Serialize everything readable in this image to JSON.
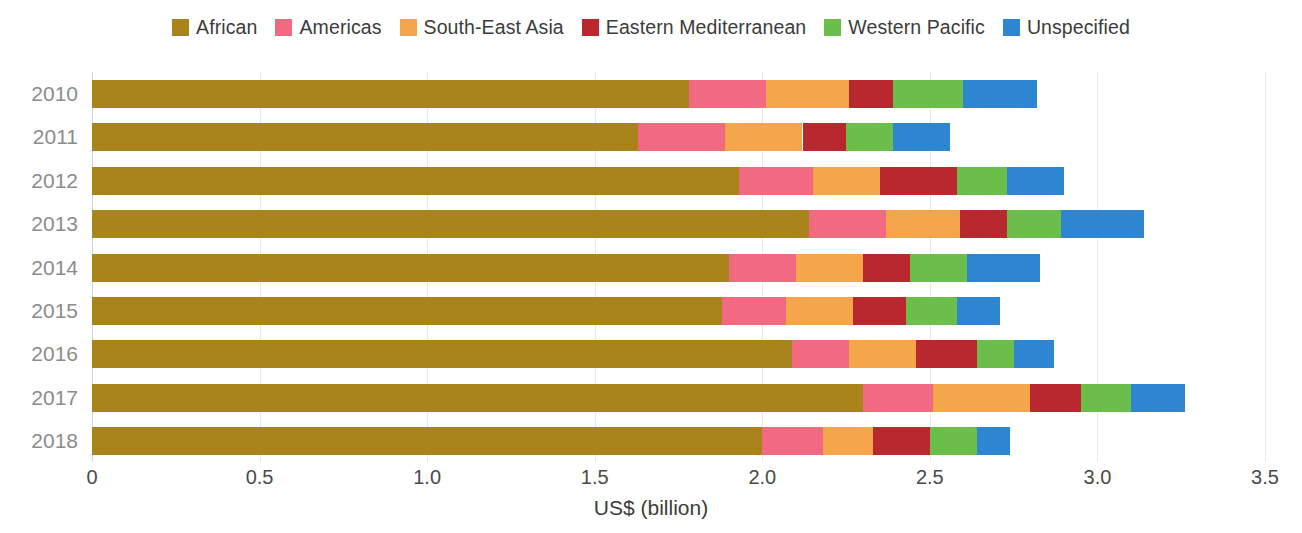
{
  "chart_data": {
    "type": "bar",
    "orientation": "horizontal",
    "stacked": true,
    "title": "",
    "subtitle": "",
    "xlabel": "US$ (billion)",
    "ylabel": "",
    "xlim": [
      0,
      3.5
    ],
    "xticks": [
      "0",
      "0.5",
      "1.0",
      "1.5",
      "2.0",
      "2.5",
      "3.0",
      "3.5"
    ],
    "xtick_values": [
      0,
      0.5,
      1.0,
      1.5,
      2.0,
      2.5,
      3.0,
      3.5
    ],
    "grid": true,
    "grid_axis": "x",
    "legend_position": "top-center",
    "categories": [
      "2010",
      "2011",
      "2012",
      "2013",
      "2014",
      "2015",
      "2016",
      "2017",
      "2018"
    ],
    "series": [
      {
        "name": "African",
        "color": "#A8841A",
        "values": [
          1.78,
          1.63,
          1.93,
          2.14,
          1.9,
          1.88,
          2.09,
          2.3,
          2.0
        ]
      },
      {
        "name": "Americas",
        "color": "#F26A82",
        "values": [
          0.23,
          0.26,
          0.22,
          0.23,
          0.2,
          0.19,
          0.17,
          0.21,
          0.18
        ]
      },
      {
        "name": "South-East Asia",
        "color": "#F5A64A",
        "values": [
          0.25,
          0.23,
          0.2,
          0.22,
          0.2,
          0.2,
          0.2,
          0.29,
          0.15
        ]
      },
      {
        "name": "Eastern Mediterranean",
        "color": "#B8282E",
        "values": [
          0.13,
          0.13,
          0.23,
          0.14,
          0.14,
          0.16,
          0.18,
          0.15,
          0.17
        ]
      },
      {
        "name": "Western Pacific",
        "color": "#6BBE4A",
        "values": [
          0.21,
          0.14,
          0.15,
          0.16,
          0.17,
          0.15,
          0.11,
          0.15,
          0.14
        ]
      },
      {
        "name": "Unspecified",
        "color": "#2E86D0",
        "values": [
          0.22,
          0.17,
          0.17,
          0.25,
          0.22,
          0.13,
          0.12,
          0.16,
          0.1
        ]
      }
    ],
    "totals": [
      2.82,
      2.56,
      2.9,
      3.14,
      2.83,
      2.71,
      2.87,
      3.26,
      2.74
    ]
  },
  "legend": {
    "items": [
      {
        "label": "African",
        "color": "#A8841A"
      },
      {
        "label": "Americas",
        "color": "#F26A82"
      },
      {
        "label": "South-East Asia",
        "color": "#F5A64A"
      },
      {
        "label": "Eastern Mediterranean",
        "color": "#B8282E"
      },
      {
        "label": "Western Pacific",
        "color": "#6BBE4A"
      },
      {
        "label": "Unspecified",
        "color": "#2E86D0"
      }
    ]
  },
  "axis": {
    "x_title": "US$ (billion)",
    "x_tick_labels": [
      "0",
      "0.5",
      "1.0",
      "1.5",
      "2.0",
      "2.5",
      "3.0",
      "3.5"
    ],
    "y_tick_labels": [
      "2010",
      "2011",
      "2012",
      "2013",
      "2014",
      "2015",
      "2016",
      "2017",
      "2018"
    ]
  },
  "colors": {
    "african": "#A8841A",
    "americas": "#F26A82",
    "south_east_asia": "#F5A64A",
    "eastern_mediterranean": "#B8282E",
    "western_pacific": "#6BBE4A",
    "unspecified": "#2E86D0",
    "gridline": "#e9e9e9",
    "axis_label": "#4a4a4a",
    "year_label": "#8c8c8c",
    "background": "#ffffff"
  },
  "layout": {
    "plot_left_px": 92,
    "plot_right_px": 1265,
    "plot_top_px": 76,
    "row_height_px": 43.4,
    "bar_height_px": 28
  }
}
